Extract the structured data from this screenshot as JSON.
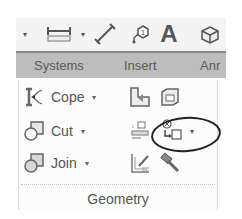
{
  "quick_access_toolbar": {
    "items": [
      {
        "icon": "dropdown-arrow-icon",
        "glyph": "▾"
      },
      {
        "icon": "aligned-dimension-icon"
      },
      {
        "icon": "dropdown-arrow-icon",
        "glyph": "▾"
      },
      {
        "icon": "measure-icon"
      },
      {
        "icon": "tag-icon",
        "badge": "1"
      },
      {
        "icon": "text-icon",
        "glyph": "A"
      },
      {
        "icon": "3d-view-icon"
      }
    ]
  },
  "ribbon_tabs": {
    "items": [
      {
        "label": "Systems"
      },
      {
        "label": "Insert"
      },
      {
        "label": "Anr"
      }
    ]
  },
  "geometry_panel": {
    "title": "Geometry",
    "commands": [
      {
        "label": "Cope",
        "icon": "cope-icon",
        "arrow": "▾"
      },
      {
        "label": "Cut",
        "icon": "cut-icon",
        "arrow": "▾"
      },
      {
        "label": "Join",
        "icon": "join-icon",
        "arrow": "▾"
      }
    ],
    "small_buttons": [
      {
        "icon": "wall-joins-icon"
      },
      {
        "icon": "split-face-icon"
      },
      {
        "icon": "join-roof-icon"
      },
      {
        "icon": "separate-geometry-icon",
        "arrow": "▾",
        "highlighted": true
      },
      {
        "icon": "paint-icon"
      },
      {
        "icon": "demolish-hammer-icon"
      }
    ]
  },
  "colors": {
    "tab_strip": "#bdbdbd",
    "panel_bg": "#fcfcfc",
    "annotation_ellipse": "#222222"
  }
}
